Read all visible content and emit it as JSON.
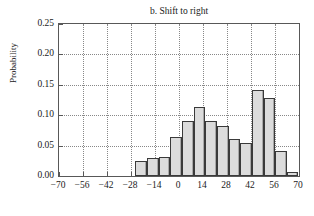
{
  "chart_data": {
    "type": "bar",
    "title": "b. Shift to right",
    "xlabel": "",
    "ylabel": "Probability",
    "xlim": [
      -70,
      70
    ],
    "ylim": [
      0.0,
      0.25
    ],
    "grid": true,
    "legend": null,
    "xticks": [
      "−70",
      "−56",
      "−42",
      "−28",
      "−14",
      "0",
      "14",
      "28",
      "42",
      "56",
      "70"
    ],
    "xtick_values": [
      -70,
      -56,
      -42,
      -28,
      -14,
      0,
      14,
      28,
      42,
      56,
      70
    ],
    "yticks": [
      "0.00",
      "0.05",
      "0.10",
      "0.15",
      "0.20",
      "0.25"
    ],
    "ytick_values": [
      0.0,
      0.05,
      0.1,
      0.15,
      0.2,
      0.25
    ],
    "bar_width": 6.8,
    "bin_left_edges": [
      -25.5,
      -18.7,
      -11.9,
      -5.1,
      1.7,
      8.5,
      15.3,
      22.1,
      28.9,
      35.7,
      42.5,
      49.3,
      56.1,
      62.9
    ],
    "categories": [
      -22.1,
      -15.3,
      -8.5,
      -1.7,
      5.1,
      11.9,
      18.7,
      25.5,
      32.3,
      39.1,
      45.9,
      52.7,
      59.5,
      66.3
    ],
    "values": [
      0.025,
      0.029,
      0.031,
      0.064,
      0.091,
      0.113,
      0.09,
      0.083,
      0.061,
      0.055,
      0.141,
      0.129,
      0.041,
      0.007
    ],
    "colors": {
      "bar_fill": "#dcdcdc",
      "bar_edge": "#3a3a3a",
      "bar_shade": "#a8a8a8",
      "gridline": "#888888",
      "axis": "#585858",
      "text": "#1a1a1a",
      "background": "#ffffff"
    }
  }
}
